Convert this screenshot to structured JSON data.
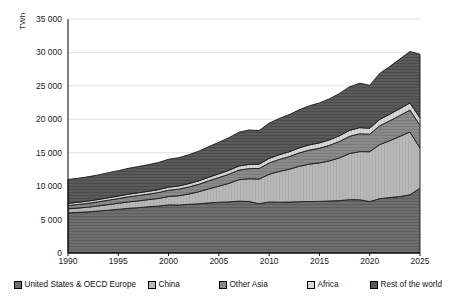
{
  "chart_data": {
    "type": "area",
    "stacked": true,
    "title": "",
    "subtitle": "",
    "xlabel": "",
    "ylabel": "TWh",
    "xlim": [
      1990,
      2025
    ],
    "ylim": [
      0,
      35000
    ],
    "ytick_labels": [
      "35 000",
      "30 000",
      "25 000",
      "20 000",
      "15 000",
      "10 000",
      "5 000",
      "0"
    ],
    "ytick_values": [
      35000,
      30000,
      25000,
      20000,
      15000,
      10000,
      5000,
      0
    ],
    "xtick_labels": [
      "1990",
      "1995",
      "2000",
      "2005",
      "2010",
      "2015",
      "2020",
      "2025"
    ],
    "xtick_values": [
      1990,
      1995,
      2000,
      2005,
      2010,
      2015,
      2020,
      2025
    ],
    "grid": "horizontal",
    "legend_position": "bottom",
    "x": [
      1990,
      1991,
      1992,
      1993,
      1994,
      1995,
      1996,
      1997,
      1998,
      1999,
      2000,
      2001,
      2002,
      2003,
      2004,
      2005,
      2006,
      2007,
      2008,
      2009,
      2010,
      2011,
      2012,
      2013,
      2014,
      2015,
      2016,
      2017,
      2018,
      2019,
      2020,
      2021,
      2022,
      2023,
      2024,
      2025
    ],
    "series": [
      {
        "name": "United States & OECD Europe",
        "fill": "#6e6e6e",
        "values": [
          6000,
          6080,
          6160,
          6280,
          6400,
          6540,
          6680,
          6780,
          6920,
          7020,
          7200,
          7180,
          7280,
          7360,
          7500,
          7600,
          7640,
          7760,
          7700,
          7380,
          7620,
          7600,
          7620,
          7680,
          7700,
          7720,
          7780,
          7840,
          7980,
          7960,
          7700,
          8120,
          8300,
          8450,
          8700,
          9700
        ]
      },
      {
        "name": "China",
        "fill": "#b8b8b8",
        "values": [
          600,
          640,
          700,
          760,
          840,
          900,
          960,
          1020,
          1060,
          1140,
          1250,
          1380,
          1550,
          1800,
          2100,
          2400,
          2780,
          3200,
          3400,
          3680,
          4150,
          4600,
          4900,
          5300,
          5600,
          5750,
          6000,
          6400,
          6900,
          7200,
          7450,
          8100,
          8500,
          9000,
          9400,
          6000
        ]
      },
      {
        "name": "Other Asia",
        "fill": "#8a8a8a",
        "values": [
          500,
          530,
          570,
          610,
          660,
          700,
          760,
          800,
          830,
          880,
          940,
          990,
          1050,
          1120,
          1200,
          1280,
          1360,
          1450,
          1520,
          1580,
          1700,
          1800,
          1900,
          2000,
          2100,
          2200,
          2320,
          2450,
          2580,
          2680,
          2620,
          2820,
          2980,
          3120,
          3280,
          3400
        ]
      },
      {
        "name": "Africa",
        "fill": "#d8d8d8",
        "values": [
          320,
          330,
          340,
          350,
          360,
          375,
          390,
          405,
          420,
          435,
          455,
          470,
          490,
          510,
          535,
          560,
          585,
          610,
          630,
          645,
          675,
          700,
          725,
          750,
          775,
          800,
          825,
          855,
          885,
          910,
          895,
          945,
          985,
          1025,
          1070,
          1110
        ]
      },
      {
        "name": "Rest of the world",
        "fill": "#5a5a5a",
        "values": [
          3580,
          3600,
          3630,
          3680,
          3740,
          3800,
          3870,
          3930,
          3990,
          4060,
          4180,
          4230,
          4320,
          4440,
          4580,
          4720,
          4880,
          5050,
          5150,
          5020,
          5280,
          5420,
          5560,
          5700,
          5850,
          5980,
          6140,
          6320,
          6520,
          6650,
          6420,
          6880,
          7150,
          7420,
          7700,
          9500
        ]
      }
    ],
    "totals": [
      11000,
      11180,
      11400,
      11680,
      12000,
      12315,
      12660,
      12935,
      13220,
      13535,
      14025,
      14250,
      14690,
      15230,
      15915,
      16560,
      17245,
      18070,
      18400,
      18305,
      19425,
      20120,
      20705,
      21430,
      22025,
      22450,
      23065,
      23865,
      24865,
      25400,
      25085,
      26865,
      27915,
      29015,
      30150,
      29710
    ]
  },
  "legend": {
    "items": [
      {
        "label": "United States & OECD Europe"
      },
      {
        "label": "China"
      },
      {
        "label": "Other Asia"
      },
      {
        "label": "Africa"
      },
      {
        "label": "Rest of the world"
      }
    ]
  }
}
